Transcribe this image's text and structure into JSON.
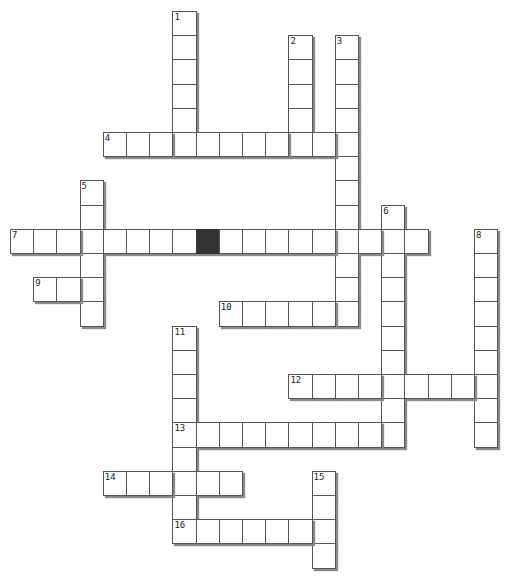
{
  "puzzle": {
    "grid": {
      "origin_x": 10,
      "origin_y": 11,
      "cell_w": 23.2,
      "cell_h": 24.2
    },
    "colors": {
      "cell_bg": "#ffffff",
      "cell_border": "#555555",
      "shadow": "#8a8a8a",
      "block": "#333333"
    },
    "words": [
      {
        "number": "1",
        "direction": "down",
        "row": 0,
        "col": 7,
        "length": 6
      },
      {
        "number": "2",
        "direction": "down",
        "row": 1,
        "col": 12,
        "length": 5
      },
      {
        "number": "3",
        "direction": "down",
        "row": 1,
        "col": 14,
        "length": 12
      },
      {
        "number": "4",
        "direction": "across",
        "row": 5,
        "col": 4,
        "length": 11
      },
      {
        "number": "5",
        "direction": "down",
        "row": 7,
        "col": 3,
        "length": 6
      },
      {
        "number": "6",
        "direction": "down",
        "row": 8,
        "col": 16,
        "length": 10
      },
      {
        "number": "7",
        "direction": "across",
        "row": 9,
        "col": 0,
        "length": 18
      },
      {
        "number": "8",
        "direction": "down",
        "row": 9,
        "col": 20,
        "length": 9
      },
      {
        "number": "9",
        "direction": "across",
        "row": 11,
        "col": 1,
        "length": 3
      },
      {
        "number": "10",
        "direction": "across",
        "row": 12,
        "col": 9,
        "length": 6
      },
      {
        "number": "11",
        "direction": "down",
        "row": 13,
        "col": 7,
        "length": 9
      },
      {
        "number": "12",
        "direction": "across",
        "row": 15,
        "col": 12,
        "length": 9
      },
      {
        "number": "13",
        "direction": "across",
        "row": 17,
        "col": 7,
        "length": 10
      },
      {
        "number": "14",
        "direction": "across",
        "row": 19,
        "col": 4,
        "length": 6
      },
      {
        "number": "15",
        "direction": "down",
        "row": 19,
        "col": 13,
        "length": 4
      },
      {
        "number": "16",
        "direction": "across",
        "row": 21,
        "col": 7,
        "length": 7
      }
    ],
    "blocks": [
      {
        "row": 9,
        "col": 8
      }
    ]
  }
}
